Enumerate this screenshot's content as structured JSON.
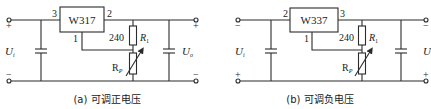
{
  "circuits": [
    {
      "id": "a",
      "regulator": "W317",
      "pin_left": "3",
      "pin_right": "2",
      "pin_adj": "1",
      "r1_value": "240",
      "r1_label": "R",
      "r1_sub": "1",
      "rp_label": "R",
      "rp_sub": "P",
      "input_label": "U",
      "input_sub": "i",
      "output_label": "U",
      "output_sub": "o",
      "top_polarity": "+",
      "bottom_polarity": "−",
      "caption": "(a) 可调正电压"
    },
    {
      "id": "b",
      "regulator": "W337",
      "pin_left": "2",
      "pin_right": "3",
      "pin_adj": "1",
      "r1_value": "240",
      "r1_label": "R",
      "r1_sub": "1",
      "rp_label": "R",
      "rp_sub": "P",
      "input_label": "U",
      "input_sub": "i",
      "output_label": "U",
      "output_sub": "",
      "top_polarity": "−",
      "bottom_polarity": "+",
      "caption": "(b) 可调负电压"
    }
  ]
}
